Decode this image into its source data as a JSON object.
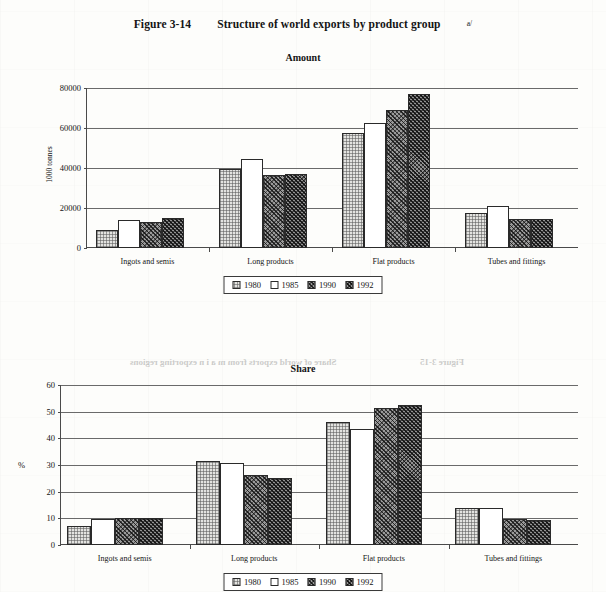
{
  "figure": {
    "number": "Figure 3-14",
    "title": "Structure of world exports by product group",
    "footnote_marker": "a/"
  },
  "legend": {
    "items": [
      {
        "label": "1980",
        "pattern": "light-stipple"
      },
      {
        "label": "1985",
        "pattern": "white-empty"
      },
      {
        "label": "1990",
        "pattern": "dark-crosshatch"
      },
      {
        "label": "1992",
        "pattern": "dark-crosshatch-dense"
      }
    ]
  },
  "ghost": {
    "line1": "Figure 3-15",
    "line2": "Share of world exports from m a i n exporting regions"
  },
  "chart_data": [
    {
      "id": "amount",
      "type": "bar",
      "title": "Amount",
      "xlabel": "",
      "ylabel": "1000 tonnes",
      "ylim": [
        0,
        80000
      ],
      "yticks": [
        0,
        20000,
        40000,
        60000,
        80000
      ],
      "ytick_labels": [
        "0",
        "20000",
        "40000",
        "60000",
        "80000"
      ],
      "grid": true,
      "legend_position": "bottom-center",
      "categories": [
        "Ingots and semis",
        "Long products",
        "Flat products",
        "Tubes and fittings"
      ],
      "series": [
        {
          "name": "1980",
          "values": [
            9000,
            39500,
            57500,
            17500
          ]
        },
        {
          "name": "1985",
          "values": [
            14000,
            44500,
            62500,
            21000
          ]
        },
        {
          "name": "1990",
          "values": [
            13200,
            36500,
            69000,
            14500
          ]
        },
        {
          "name": "1992",
          "values": [
            15000,
            37000,
            77000,
            14500
          ]
        }
      ]
    },
    {
      "id": "share",
      "type": "bar",
      "title": "Share",
      "xlabel": "",
      "ylabel": "%",
      "ylim": [
        0,
        60
      ],
      "yticks": [
        0,
        10,
        20,
        30,
        40,
        50,
        60
      ],
      "ytick_labels": [
        "0",
        "10",
        "20",
        "30",
        "40",
        "50",
        "60"
      ],
      "grid": true,
      "legend_position": "bottom-center",
      "categories": [
        "Ingots and semis",
        "Long products",
        "Flat products",
        "Tubes and fittings"
      ],
      "series": [
        {
          "name": "1980",
          "values": [
            7.3,
            31.5,
            46.0,
            14.0
          ]
        },
        {
          "name": "1985",
          "values": [
            9.7,
            30.8,
            43.5,
            14.0
          ]
        },
        {
          "name": "1990",
          "values": [
            10.0,
            26.3,
            51.5,
            9.7
          ]
        },
        {
          "name": "1992",
          "values": [
            10.3,
            25.3,
            52.5,
            9.5
          ]
        }
      ]
    }
  ]
}
